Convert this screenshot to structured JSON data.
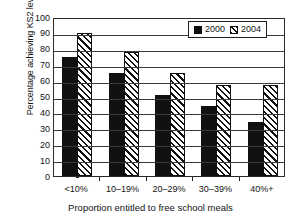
{
  "chart_data": {
    "type": "bar",
    "title": "",
    "subtitle": "",
    "xlabel": "Proportion entitled to free school meals",
    "ylabel": "Percentage achieving KS2 level 4+",
    "categories": [
      "<10%",
      "10–19%",
      "20–29%",
      "30–39%",
      "40%+"
    ],
    "series": [
      {
        "name": "2000",
        "values": [
          75,
          65,
          51,
          44,
          34
        ],
        "fill": "solid-black",
        "color": "#111111"
      },
      {
        "name": "2004",
        "values": [
          90,
          78,
          65,
          57,
          57
        ],
        "fill": "diagonal-hatch",
        "color": "#111111"
      }
    ],
    "ylim": [
      0,
      100
    ],
    "ytick_step": 10,
    "yticks": [
      0,
      10,
      20,
      30,
      40,
      50,
      60,
      70,
      80,
      90,
      100
    ],
    "ytick_labels": [
      "0",
      "10",
      "20",
      "30",
      "40",
      "50",
      "60",
      "70",
      "80",
      "90",
      "100"
    ],
    "grid": true,
    "grid_axis": "y",
    "legend_position": "top-right",
    "legend_entries": [
      "2000",
      "2004"
    ],
    "annotations": []
  },
  "axes": {
    "y_title": "Percentage achieving KS2 level 4+",
    "x_title": "Proportion entitled to free school meals"
  },
  "legend": {
    "items": [
      {
        "label": "2000",
        "swatch": "solid-square-icon"
      },
      {
        "label": "2004",
        "swatch": "hatched-square-icon"
      }
    ]
  },
  "colors": {
    "series_2000": "#111111",
    "series_2004_line": "#111111",
    "series_2004_bg": "#ffffff",
    "axis": "#232323",
    "grid": "#3a3a3a",
    "text": "#141414",
    "background": "#ffffff"
  }
}
